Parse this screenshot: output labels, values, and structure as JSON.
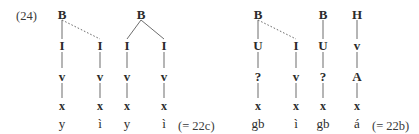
{
  "figure": {
    "example_label": "(24)",
    "type": "autosegmental-tier-diagram",
    "width": 419,
    "height": 134,
    "line_color": "#6d6d6d",
    "text_color": "#2b2b2b"
  },
  "groups": [
    {
      "id": "group-left",
      "cross_reference": "(= 22c)",
      "cross_reference_x": 178,
      "columns": [
        {
          "id": "col-1",
          "x": 62,
          "root": "B",
          "tiers": [
            "I",
            "v",
            "x"
          ],
          "segment": "y"
        },
        {
          "id": "col-2",
          "x": 100,
          "root": "",
          "tiers": [
            "I",
            "v",
            "x"
          ],
          "segment": "ì"
        },
        {
          "id": "col-3",
          "x": 127,
          "root": "",
          "tiers": [
            "I",
            "v",
            "x"
          ],
          "segment": "y"
        },
        {
          "id": "col-4",
          "x": 164,
          "root": "",
          "tiers": [
            "I",
            "v",
            "x"
          ],
          "segment": "ì"
        }
      ],
      "roots": [
        {
          "label": "B",
          "x": 62
        },
        {
          "label": "B",
          "x": 141
        }
      ],
      "association_lines": [
        {
          "from_x": 62,
          "to_x": 62,
          "style": "solid"
        },
        {
          "from_x": 62,
          "to_x": 100,
          "style": "dotted"
        },
        {
          "from_x": 141,
          "to_x": 127,
          "style": "solid"
        },
        {
          "from_x": 141,
          "to_x": 164,
          "style": "solid"
        }
      ]
    },
    {
      "id": "group-right",
      "cross_reference": "(= 22b)",
      "cross_reference_x": 372,
      "columns": [
        {
          "id": "col-5",
          "x": 258,
          "root": "B",
          "tiers": [
            "U",
            "?",
            "x"
          ],
          "segment": "gb"
        },
        {
          "id": "col-6",
          "x": 296,
          "root": "",
          "tiers": [
            "I",
            "v",
            "x"
          ],
          "segment": "ì"
        },
        {
          "id": "col-7",
          "x": 323,
          "root": "B",
          "tiers": [
            "U",
            "?",
            "x"
          ],
          "segment": "gb"
        },
        {
          "id": "col-8",
          "x": 357,
          "root": "H",
          "tiers": [
            "v",
            "A",
            "x"
          ],
          "segment": "á"
        }
      ],
      "roots": [
        {
          "label": "B",
          "x": 258
        },
        {
          "label": "B",
          "x": 323
        },
        {
          "label": "H",
          "x": 357
        }
      ],
      "association_lines": [
        {
          "from_x": 258,
          "to_x": 258,
          "style": "solid"
        },
        {
          "from_x": 258,
          "to_x": 296,
          "style": "dotted"
        },
        {
          "from_x": 323,
          "to_x": 323,
          "style": "solid"
        },
        {
          "from_x": 357,
          "to_x": 357,
          "style": "solid"
        }
      ]
    }
  ],
  "rows": {
    "root_y": 14,
    "tier1_y": 45,
    "tier2_y": 76,
    "tier3_y": 106,
    "segment_y": 124
  }
}
